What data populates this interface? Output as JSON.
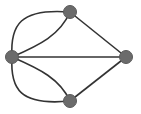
{
  "graph": {
    "node_color": "#6b6b6b",
    "node_stroke": "#555555",
    "edge_color": "#333333",
    "nodes": [
      {
        "id": "left",
        "x": 12,
        "y": 57
      },
      {
        "id": "top",
        "x": 70,
        "y": 12
      },
      {
        "id": "right",
        "x": 126,
        "y": 57
      },
      {
        "id": "bottom",
        "x": 70,
        "y": 101
      }
    ],
    "edges": [
      {
        "from": "left",
        "to": "top",
        "style": "curved-outer"
      },
      {
        "from": "left",
        "to": "top",
        "style": "curved-inner"
      },
      {
        "from": "left",
        "to": "bottom",
        "style": "curved-outer"
      },
      {
        "from": "left",
        "to": "bottom",
        "style": "curved-inner"
      },
      {
        "from": "left",
        "to": "right",
        "style": "straight"
      },
      {
        "from": "top",
        "to": "right",
        "style": "straight"
      },
      {
        "from": "bottom",
        "to": "right",
        "style": "straight"
      }
    ]
  }
}
